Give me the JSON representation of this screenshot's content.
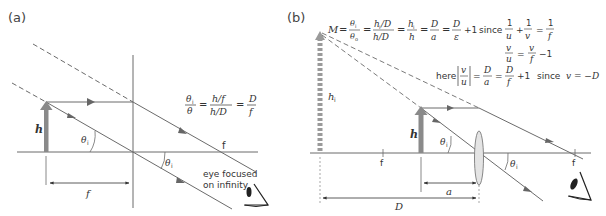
{
  "panels": [
    {
      "label": "(a)",
      "object_height_label": "h",
      "angle_label": "θ",
      "angle_sub": "i",
      "focal_label": "f",
      "focal_distance_label": "f",
      "equation": {
        "lhs_num": "θ",
        "lhs_num_sub": "i",
        "lhs_den": "θ",
        "mid_num": "h/f",
        "mid_den": "h/D",
        "rhs_num": "D",
        "rhs_den": "f"
      },
      "eye_caption_line1": "eye focused",
      "eye_caption_line2": "on infinity"
    },
    {
      "label": "(b)",
      "object_height_label": "h",
      "image_height_label": "h",
      "image_height_sub": "i",
      "angle_label": "θ",
      "angle_sub": "i",
      "focal_left_label": "f",
      "focal_right_label": "f",
      "distance_a_label": "a",
      "distance_D_label": "D",
      "equation_main": {
        "M": "M",
        "eq": "=",
        "t1_num": "θ",
        "t1_num_sub": "i",
        "t1_den": "θ",
        "t1_den_sub": "o",
        "t2_num": "h",
        "t2_num_sub": "i",
        "t2_num_tail": "/D",
        "t2_den": "h/D",
        "t3_num": "h",
        "t3_num_sub": "i",
        "t3_den": "h",
        "t4_num": "D",
        "t4_den": "a",
        "t5_num": "D",
        "t5_den": "ε",
        "plus_one": "+1",
        "since": "since"
      },
      "lens_eq": {
        "n1": "1",
        "d1": "u",
        "plus": "+",
        "n2": "1",
        "d2": "v",
        "eq": "=",
        "n3": "1",
        "d3": "f"
      },
      "ratio_eq": {
        "n1": "v",
        "d1": "u",
        "eq": "=",
        "n2": "v",
        "d2": "f",
        "minus_one": "−1"
      },
      "here_eq": {
        "here": "here",
        "abs_num": "v",
        "abs_den": "u",
        "t1_num": "D",
        "t1_den": "a",
        "t2_num": "D",
        "t2_den": "f",
        "plus_one": "+1",
        "since": "since",
        "condition": "v = −D"
      }
    }
  ],
  "colors": {
    "line": "#6b6b6b",
    "arrow_fill": "#8a8a8a",
    "text": "#333333",
    "lens_fill": "#e4e4e4"
  }
}
